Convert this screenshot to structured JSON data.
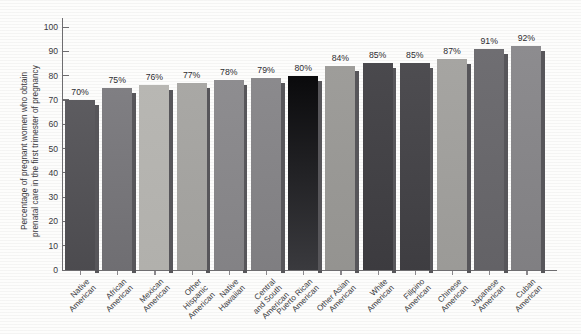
{
  "chart_data": {
    "type": "bar",
    "title": "",
    "xlabel": "",
    "ylabel": "Percentage of pregnant women who obtain prenatal care in the first trimester of pregnancy",
    "ylim": [
      0,
      100
    ],
    "yticks": [
      0,
      10,
      20,
      30,
      40,
      50,
      60,
      70,
      80,
      90,
      100
    ],
    "grid": false,
    "legend": "none",
    "categories": [
      "Native American",
      "African American",
      "Mexican American",
      "Other Hispanic American",
      "Native Hawaiian",
      "Central and South American",
      "Puerto Rican American",
      "Other Asian American",
      "White American",
      "Filipino American",
      "Chinese American",
      "Japanese American",
      "Cuban American"
    ],
    "category_lines": [
      [
        "Native",
        "American"
      ],
      [
        "African",
        "American"
      ],
      [
        "Mexican",
        "American"
      ],
      [
        "Other",
        "Hispanic",
        "American"
      ],
      [
        "Native",
        "Hawaiian"
      ],
      [
        "Central",
        "and South",
        "American"
      ],
      [
        "Puerto Rican",
        "American"
      ],
      [
        "Other Asian",
        "American"
      ],
      [
        "White",
        "American"
      ],
      [
        "Filipino",
        "American"
      ],
      [
        "Chinese",
        "American"
      ],
      [
        "Japanese",
        "American"
      ],
      [
        "Cuban",
        "American"
      ]
    ],
    "values": [
      70,
      75,
      76,
      77,
      78,
      79,
      80,
      84,
      85,
      85,
      87,
      91,
      92
    ],
    "value_labels": [
      "70%",
      "75%",
      "76%",
      "77%",
      "78%",
      "79%",
      "80%",
      "84%",
      "85%",
      "85%",
      "87%",
      "91%",
      "92%"
    ],
    "bar_colors": [
      "#5d5c60",
      "#807f83",
      "#b8b7b3",
      "#a9a8a5",
      "#8e8d90",
      "#8b8a8d",
      "#0a0a0c",
      "#9e9d9a",
      "#4a494d",
      "#4e4d51",
      "#a6a5a2",
      "#6f6e72",
      "#8d8c8f"
    ],
    "bar_colors_bottom": [
      "#4c4b4f",
      "#6f6e72",
      "#b1b0ac",
      "#a09f9c",
      "#838285",
      "#7f7e81",
      "#3a3a3e",
      "#949390",
      "#3c3b3f",
      "#3e3d41",
      "#9b9a97",
      "#636266",
      "#807f82"
    ]
  },
  "axis": {
    "line_color": "#6e6d70",
    "text_color": "#39383c"
  }
}
